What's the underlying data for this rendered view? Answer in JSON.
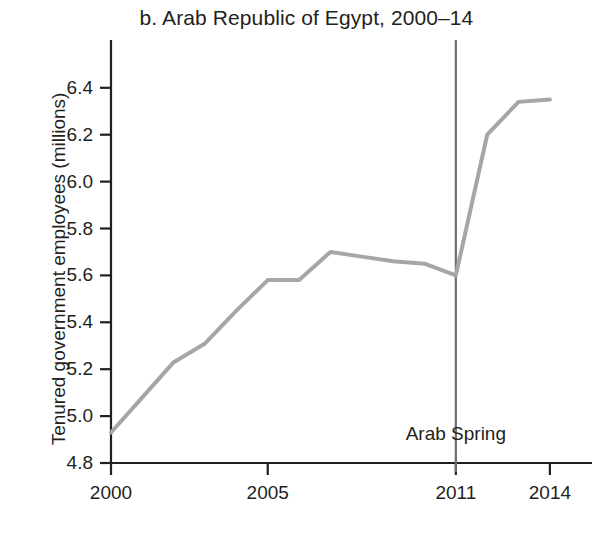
{
  "chart_data": {
    "type": "line",
    "title": "b. Arab Republic of Egypt, 2000–14",
    "xlabel": "",
    "ylabel": "Tenured government employees (millions)",
    "xlim": [
      2000,
      2014
    ],
    "ylim": [
      4.8,
      6.5
    ],
    "grid": false,
    "legend": "none",
    "x": [
      2000,
      2001,
      2002,
      2003,
      2004,
      2005,
      2006,
      2007,
      2008,
      2009,
      2010,
      2011,
      2012,
      2013,
      2014
    ],
    "values": [
      4.93,
      5.08,
      5.23,
      5.31,
      5.45,
      5.58,
      5.58,
      5.7,
      5.68,
      5.66,
      5.65,
      5.6,
      6.2,
      6.34,
      6.35
    ],
    "series": [
      {
        "name": "Tenured government employees",
        "color": "#a6a6a6",
        "values": [
          4.93,
          5.08,
          5.23,
          5.31,
          5.45,
          5.58,
          5.58,
          5.7,
          5.68,
          5.66,
          5.65,
          5.6,
          6.2,
          6.34,
          6.35
        ]
      }
    ],
    "ytick_labels": [
      "4.8",
      "5.0",
      "5.2",
      "5.4",
      "5.6",
      "5.8",
      "6.0",
      "6.2",
      "6.4"
    ],
    "ytick_values": [
      4.8,
      5.0,
      5.2,
      5.4,
      5.6,
      5.8,
      6.0,
      6.2,
      6.4
    ],
    "xtick_labels": [
      "2000",
      "2005",
      "2011",
      "2014"
    ],
    "xtick_values": [
      2000,
      2005,
      2011,
      2014
    ],
    "annotations": [
      {
        "name": "arab-spring",
        "label": "Arab Spring",
        "x": 2011,
        "label_y": 4.92,
        "type": "vertical-line",
        "color": "#6d6e71"
      }
    ],
    "axis_color": "#231f20"
  }
}
